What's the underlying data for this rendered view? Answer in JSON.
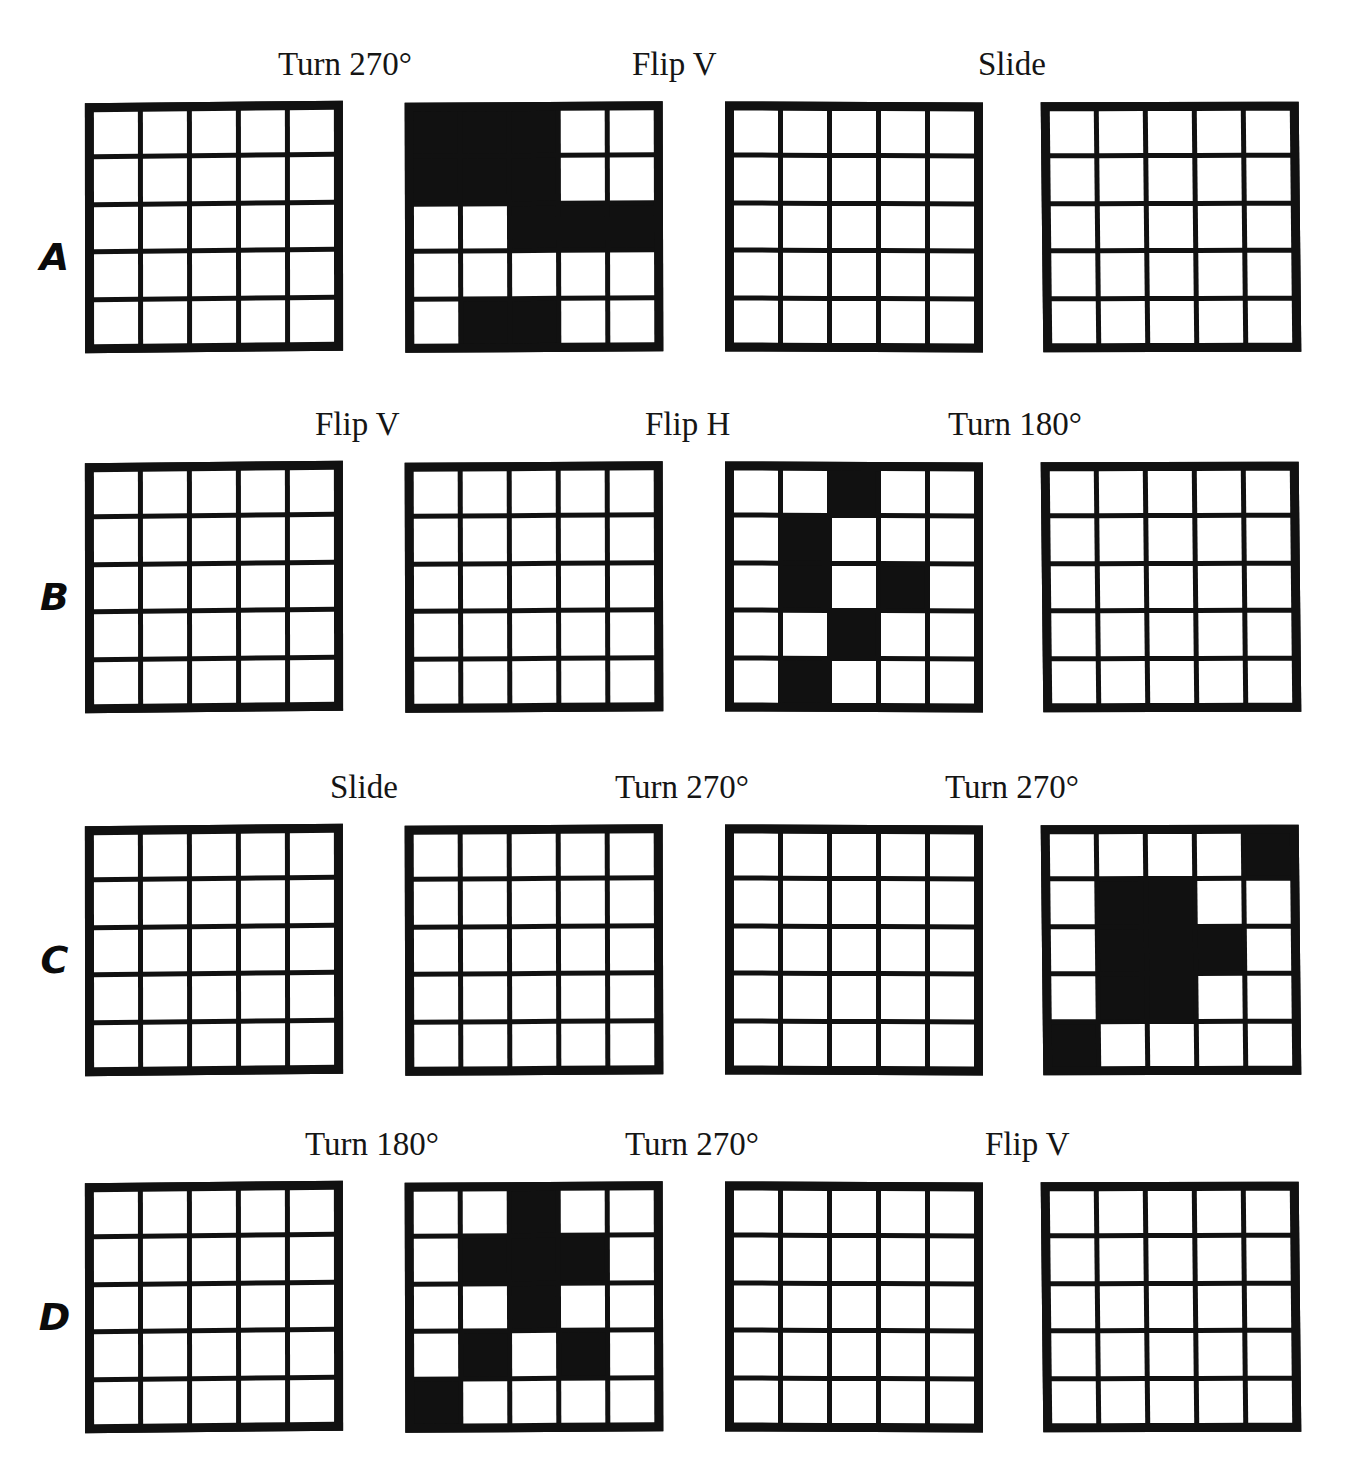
{
  "page": {
    "grid_size": "5x5",
    "fill_color": "#111111",
    "empty_color": "#ffffff",
    "border_color": "#111111"
  },
  "rows": [
    {
      "letter": "A",
      "captions": [
        "Turn 270°",
        "Flip V",
        "Slide"
      ],
      "grids": [
        {
          "name": "grid-a1",
          "filled": false,
          "cells": [
            [
              0,
              0,
              0,
              0,
              0
            ],
            [
              0,
              0,
              0,
              0,
              0
            ],
            [
              0,
              0,
              0,
              0,
              0
            ],
            [
              0,
              0,
              0,
              0,
              0
            ],
            [
              0,
              0,
              0,
              0,
              0
            ]
          ]
        },
        {
          "name": "grid-a2",
          "filled": true,
          "cells": [
            [
              1,
              1,
              1,
              0,
              0
            ],
            [
              1,
              1,
              1,
              0,
              0
            ],
            [
              0,
              0,
              1,
              1,
              1
            ],
            [
              0,
              0,
              0,
              0,
              0
            ],
            [
              0,
              1,
              1,
              0,
              0
            ]
          ]
        },
        {
          "name": "grid-a3",
          "filled": false,
          "cells": [
            [
              0,
              0,
              0,
              0,
              0
            ],
            [
              0,
              0,
              0,
              0,
              0
            ],
            [
              0,
              0,
              0,
              0,
              0
            ],
            [
              0,
              0,
              0,
              0,
              0
            ],
            [
              0,
              0,
              0,
              0,
              0
            ]
          ]
        },
        {
          "name": "grid-a4",
          "filled": false,
          "cells": [
            [
              0,
              0,
              0,
              0,
              0
            ],
            [
              0,
              0,
              0,
              0,
              0
            ],
            [
              0,
              0,
              0,
              0,
              0
            ],
            [
              0,
              0,
              0,
              0,
              0
            ],
            [
              0,
              0,
              0,
              0,
              0
            ]
          ]
        }
      ]
    },
    {
      "letter": "B",
      "captions": [
        "Flip V",
        "Flip H",
        "Turn 180°"
      ],
      "grids": [
        {
          "name": "grid-b1",
          "filled": false,
          "cells": [
            [
              0,
              0,
              0,
              0,
              0
            ],
            [
              0,
              0,
              0,
              0,
              0
            ],
            [
              0,
              0,
              0,
              0,
              0
            ],
            [
              0,
              0,
              0,
              0,
              0
            ],
            [
              0,
              0,
              0,
              0,
              0
            ]
          ]
        },
        {
          "name": "grid-b2",
          "filled": false,
          "cells": [
            [
              0,
              0,
              0,
              0,
              0
            ],
            [
              0,
              0,
              0,
              0,
              0
            ],
            [
              0,
              0,
              0,
              0,
              0
            ],
            [
              0,
              0,
              0,
              0,
              0
            ],
            [
              0,
              0,
              0,
              0,
              0
            ]
          ]
        },
        {
          "name": "grid-b3",
          "filled": true,
          "cells": [
            [
              0,
              0,
              1,
              0,
              0
            ],
            [
              0,
              1,
              0,
              0,
              0
            ],
            [
              0,
              1,
              0,
              1,
              0
            ],
            [
              0,
              0,
              1,
              0,
              0
            ],
            [
              0,
              1,
              0,
              0,
              0
            ]
          ]
        },
        {
          "name": "grid-b4",
          "filled": false,
          "cells": [
            [
              0,
              0,
              0,
              0,
              0
            ],
            [
              0,
              0,
              0,
              0,
              0
            ],
            [
              0,
              0,
              0,
              0,
              0
            ],
            [
              0,
              0,
              0,
              0,
              0
            ],
            [
              0,
              0,
              0,
              0,
              0
            ]
          ]
        }
      ]
    },
    {
      "letter": "C",
      "captions": [
        "Slide",
        "Turn 270°",
        "Turn 270°"
      ],
      "grids": [
        {
          "name": "grid-c1",
          "filled": false,
          "cells": [
            [
              0,
              0,
              0,
              0,
              0
            ],
            [
              0,
              0,
              0,
              0,
              0
            ],
            [
              0,
              0,
              0,
              0,
              0
            ],
            [
              0,
              0,
              0,
              0,
              0
            ],
            [
              0,
              0,
              0,
              0,
              0
            ]
          ]
        },
        {
          "name": "grid-c2",
          "filled": false,
          "cells": [
            [
              0,
              0,
              0,
              0,
              0
            ],
            [
              0,
              0,
              0,
              0,
              0
            ],
            [
              0,
              0,
              0,
              0,
              0
            ],
            [
              0,
              0,
              0,
              0,
              0
            ],
            [
              0,
              0,
              0,
              0,
              0
            ]
          ]
        },
        {
          "name": "grid-c3",
          "filled": false,
          "cells": [
            [
              0,
              0,
              0,
              0,
              0
            ],
            [
              0,
              0,
              0,
              0,
              0
            ],
            [
              0,
              0,
              0,
              0,
              0
            ],
            [
              0,
              0,
              0,
              0,
              0
            ],
            [
              0,
              0,
              0,
              0,
              0
            ]
          ]
        },
        {
          "name": "grid-c4",
          "filled": true,
          "cells": [
            [
              0,
              0,
              0,
              0,
              1
            ],
            [
              0,
              1,
              1,
              0,
              0
            ],
            [
              0,
              1,
              1,
              1,
              0
            ],
            [
              0,
              1,
              1,
              0,
              0
            ],
            [
              1,
              0,
              0,
              0,
              0
            ]
          ]
        }
      ]
    },
    {
      "letter": "D",
      "captions": [
        "Turn 180°",
        "Turn 270°",
        "Flip V"
      ],
      "grids": [
        {
          "name": "grid-d1",
          "filled": false,
          "cells": [
            [
              0,
              0,
              0,
              0,
              0
            ],
            [
              0,
              0,
              0,
              0,
              0
            ],
            [
              0,
              0,
              0,
              0,
              0
            ],
            [
              0,
              0,
              0,
              0,
              0
            ],
            [
              0,
              0,
              0,
              0,
              0
            ]
          ]
        },
        {
          "name": "grid-d2",
          "filled": true,
          "cells": [
            [
              0,
              0,
              1,
              0,
              0
            ],
            [
              0,
              1,
              1,
              1,
              0
            ],
            [
              0,
              0,
              1,
              0,
              0
            ],
            [
              0,
              1,
              0,
              1,
              0
            ],
            [
              1,
              0,
              0,
              0,
              0
            ]
          ]
        },
        {
          "name": "grid-d3",
          "filled": false,
          "cells": [
            [
              0,
              0,
              0,
              0,
              0
            ],
            [
              0,
              0,
              0,
              0,
              0
            ],
            [
              0,
              0,
              0,
              0,
              0
            ],
            [
              0,
              0,
              0,
              0,
              0
            ],
            [
              0,
              0,
              0,
              0,
              0
            ]
          ]
        },
        {
          "name": "grid-d4",
          "filled": false,
          "cells": [
            [
              0,
              0,
              0,
              0,
              0
            ],
            [
              0,
              0,
              0,
              0,
              0
            ],
            [
              0,
              0,
              0,
              0,
              0
            ],
            [
              0,
              0,
              0,
              0,
              0
            ],
            [
              0,
              0,
              0,
              0,
              0
            ]
          ]
        }
      ]
    }
  ],
  "layout": {
    "grid_left_positions": [
      85,
      405,
      725,
      1042
    ],
    "caption_left_positions": [
      278,
      632,
      978
    ],
    "row_a_caption_left_positions": [
      278,
      632,
      978
    ],
    "row_b_caption_left_positions": [
      315,
      645,
      948
    ],
    "row_c_caption_left_positions": [
      330,
      615,
      945
    ],
    "row_d_caption_left_positions": [
      305,
      625,
      985
    ]
  }
}
